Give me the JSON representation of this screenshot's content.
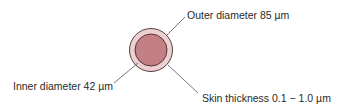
{
  "diagram": {
    "labels": {
      "outer": "Outer diameter 85 µm",
      "inner": "Inner diameter 42 µm",
      "skin": "Skin thickness 0.1 − 1.0 µm"
    },
    "colors": {
      "outer_fill": "#ecd0d2",
      "inner_fill": "#c27f84",
      "outline": "#4a2a2c",
      "leader": "#555555"
    }
  }
}
